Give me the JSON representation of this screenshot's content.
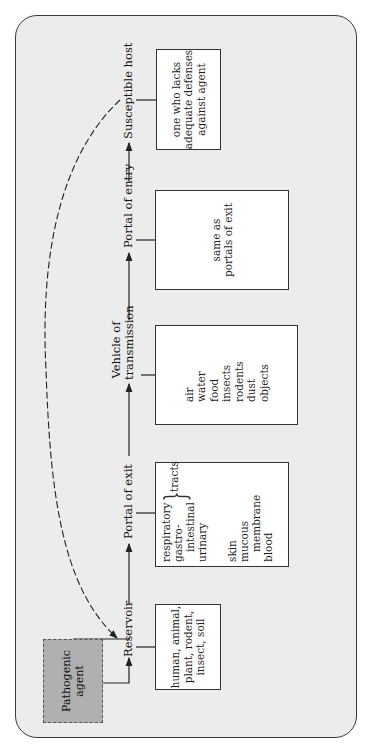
{
  "diagram": {
    "orientation": "rotated-90-ccw",
    "pathogenic_agent": {
      "label": "Pathogenic\nagent",
      "fill": "#b0b0b0"
    },
    "stages": [
      {
        "id": "reservoir",
        "label": "Reservoir",
        "box": "human, animal,\nplant, rodent,\ninsect, soil"
      },
      {
        "id": "portal_exit",
        "label": "Portal of exit",
        "box_list": [
          "respiratory",
          "gastro-",
          "intestinal",
          "urinary"
        ],
        "brace_label": "tracts",
        "box_list2": [
          "skin",
          "mucous",
          "membrane",
          "blood"
        ]
      },
      {
        "id": "vehicle",
        "label": "Vehicle of\ntransmission",
        "box": "air\nwater\nfood\ninsects\nrodents\ndust\nobjects"
      },
      {
        "id": "portal_entry",
        "label": "Portal of entry",
        "box": "same as\nportals of exit"
      },
      {
        "id": "host",
        "label": "Susceptible host",
        "box": "one who lacks\nadequate defenses\nagainst agent"
      }
    ],
    "feedback_arrow": {
      "from": "Susceptible host",
      "to": "Reservoir",
      "style": "dashed"
    },
    "colors": {
      "frame_bg": "#ececec",
      "frame_border": "#3a3a3a",
      "box_bg": "#ffffff",
      "line": "#222222"
    }
  }
}
